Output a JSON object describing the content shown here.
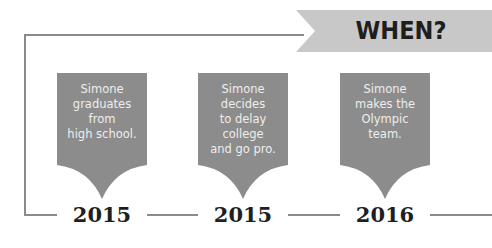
{
  "banner": {
    "title": "WHEN?",
    "color": "#c8c8c8"
  },
  "colors": {
    "card": "#8c8c8c",
    "card_text": "#eeeeee",
    "line": "#8a8a8a",
    "year_text": "#1f1f1f"
  },
  "timeline": [
    {
      "year": "2015",
      "event": "Simone\ngraduates\nfrom\nhigh school."
    },
    {
      "year": "2015",
      "event": "Simone\ndecides\nto delay\ncollege\nand go pro."
    },
    {
      "year": "2016",
      "event": "Simone\nmakes the\nOlympic\nteam."
    }
  ]
}
